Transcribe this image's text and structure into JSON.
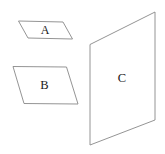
{
  "figure": {
    "background_color": "#ffffff",
    "stroke_color": "#888888",
    "label_color": "#1a1a1a",
    "canvas": {
      "width": 165,
      "height": 154
    },
    "shapes": [
      {
        "id": "plane-a",
        "label": "A",
        "kind": "parallelogram",
        "points": "18.5,21 63,22 72.5,39 28,38",
        "label_x": 45,
        "label_y": 31
      },
      {
        "id": "plane-b",
        "label": "B",
        "kind": "parallelogram",
        "points": "13,66.5 66.5,67 78,104 24,103.5",
        "label_x": 44.5,
        "label_y": 85.5
      },
      {
        "id": "plane-c",
        "label": "C",
        "kind": "parallelogram",
        "points": "90,44.5 155,12 155,120 90,145"
      }
    ]
  }
}
